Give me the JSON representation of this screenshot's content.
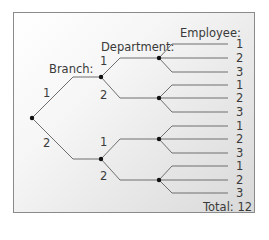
{
  "diagram": {
    "type": "tree",
    "headers": {
      "branch": "Branch:",
      "department": "Department:",
      "employee": "Employee:"
    },
    "total_label": "Total: 12",
    "colors": {
      "line": "#6e6e6e",
      "node": "#111111",
      "text": "#3a3a3a",
      "border": "#8a8a8a"
    },
    "levels": [
      "Branch",
      "Department",
      "Employee"
    ],
    "branches": [
      {
        "label": "1",
        "departments": [
          {
            "label": "1",
            "employees": [
              "1",
              "2",
              "3"
            ]
          },
          {
            "label": "2",
            "employees": [
              "1",
              "2",
              "3"
            ]
          }
        ]
      },
      {
        "label": "2",
        "departments": [
          {
            "label": "1",
            "employees": [
              "1",
              "2",
              "3"
            ]
          },
          {
            "label": "2",
            "employees": [
              "1",
              "2",
              "3"
            ]
          }
        ]
      }
    ],
    "leaf_labels": [
      "1",
      "2",
      "3",
      "1",
      "2",
      "3",
      "1",
      "2",
      "3",
      "1",
      "2",
      "3"
    ],
    "total": 12
  }
}
